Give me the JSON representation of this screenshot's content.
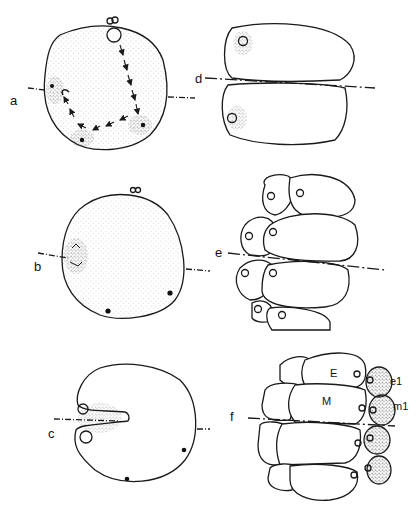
{
  "figure": {
    "panels": [
      {
        "id": "a",
        "label": "a",
        "description": "single cell with pronuclei migration arrows"
      },
      {
        "id": "b",
        "label": "b",
        "description": "single cell with polar bodies and spindle"
      },
      {
        "id": "c",
        "label": "c",
        "description": "single cell with cleavage furrow"
      },
      {
        "id": "d",
        "label": "d",
        "description": "two-cell stage"
      },
      {
        "id": "e",
        "label": "e",
        "description": "eight-cell stage"
      },
      {
        "id": "f",
        "label": "f",
        "description": "multicellular stage with labeled blastomeres"
      }
    ],
    "cell_labels": {
      "E": "E",
      "M": "M",
      "e1": "e1",
      "m1": "m1"
    },
    "colors": {
      "ink": "#1a1a1a",
      "background": "#ffffff"
    }
  }
}
